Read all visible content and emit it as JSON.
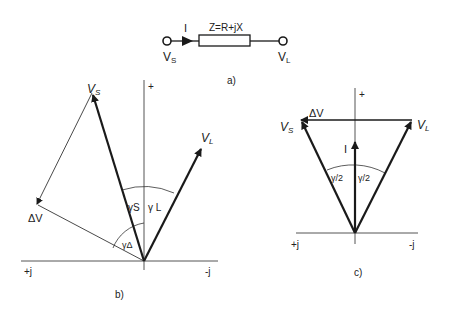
{
  "panel_a": {
    "caption": "a)",
    "impedance_label": "Z=R+jX",
    "current_label": "I",
    "source_label": "V",
    "source_sub": "S",
    "load_label": "V",
    "load_sub": "L"
  },
  "panel_b": {
    "caption": "b)",
    "axis_plus": "+",
    "axis_pos_j": "+j",
    "axis_neg_j": "-j",
    "vs_label": "V",
    "vs_sub": "S",
    "vl_label": "V",
    "vl_sub": "L",
    "dv_label": "ΔV",
    "gamma_s": "γS",
    "gamma_l": "γ L",
    "gamma_delta": "γΔ"
  },
  "panel_c": {
    "caption": "c)",
    "axis_plus": "+",
    "axis_pos_j": "+j",
    "axis_neg_j": "-j",
    "vs_label": "V",
    "vs_sub": "S",
    "vl_label": "V",
    "vl_sub": "L",
    "dv_label": "ΔV",
    "current_label": "I",
    "gamma_half_left": "γ/2",
    "gamma_half_right": "γ/2"
  },
  "colors": {
    "stroke": "#1a1a1a",
    "axis": "#555555",
    "background": "#ffffff"
  }
}
